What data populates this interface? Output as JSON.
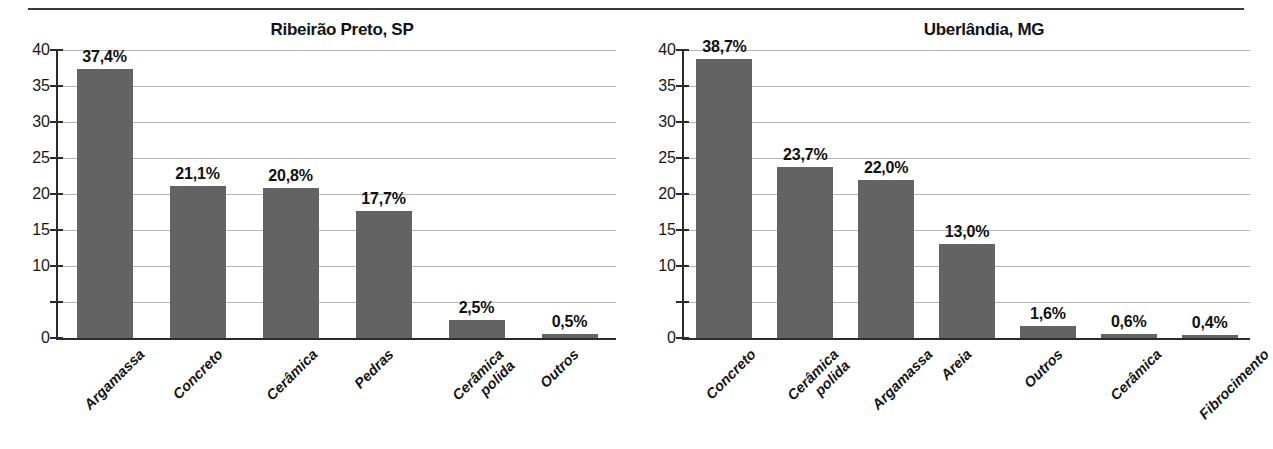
{
  "chart_data": [
    {
      "type": "bar",
      "title": "Ribeirão Preto, SP",
      "xlabel": "",
      "ylabel": "",
      "ylim": [
        0,
        40
      ],
      "yticks": [
        0,
        5,
        10,
        15,
        20,
        25,
        30,
        35,
        40
      ],
      "ytick_labels": [
        "0",
        "",
        "10",
        "15",
        "20",
        "25",
        "30",
        "35",
        "40"
      ],
      "grid": true,
      "legend": "none",
      "bar_color": "#636363",
      "categories": [
        "Argamassa",
        "Concreto",
        "Cerâmica",
        "Pedras",
        "Cerâmica polida",
        "Outros"
      ],
      "category_lines": [
        [
          "Argamassa"
        ],
        [
          "Concreto"
        ],
        [
          "Cerâmica"
        ],
        [
          "Pedras"
        ],
        [
          "Cerâmica",
          "polida"
        ],
        [
          "Outros"
        ]
      ],
      "values": [
        37.4,
        21.1,
        20.8,
        17.7,
        2.5,
        0.5
      ],
      "value_labels": [
        "37,4%",
        "21,1%",
        "20,8%",
        "17,7%",
        "2,5%",
        "0,5%"
      ]
    },
    {
      "type": "bar",
      "title": "Uberlândia, MG",
      "xlabel": "",
      "ylabel": "",
      "ylim": [
        0,
        40
      ],
      "yticks": [
        0,
        5,
        10,
        15,
        20,
        25,
        30,
        35,
        40
      ],
      "ytick_labels": [
        "0",
        "",
        "10",
        "15",
        "20",
        "25",
        "30",
        "35",
        "40"
      ],
      "grid": true,
      "legend": "none",
      "bar_color": "#636363",
      "categories": [
        "Concreto",
        "Cerâmica polida",
        "Argamassa",
        "Areia",
        "Outros",
        "Cerâmica",
        "Fibrocimento"
      ],
      "category_lines": [
        [
          "Concreto"
        ],
        [
          "Cerâmica",
          "polida"
        ],
        [
          "Argamassa"
        ],
        [
          "Areia"
        ],
        [
          "Outros"
        ],
        [
          "Cerâmica"
        ],
        [
          "Fibrocimento"
        ]
      ],
      "values": [
        38.7,
        23.7,
        22.0,
        13.0,
        1.6,
        0.6,
        0.4
      ],
      "value_labels": [
        "38,7%",
        "23,7%",
        "22,0%",
        "13,0%",
        "1,6%",
        "0,6%",
        "0,4%"
      ]
    }
  ]
}
